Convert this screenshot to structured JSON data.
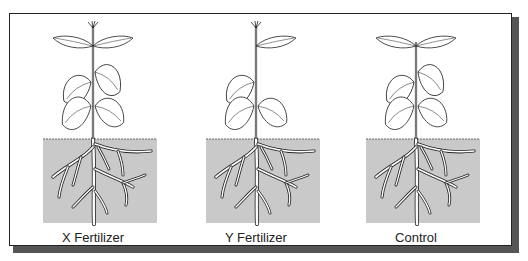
{
  "figure": {
    "panels": [
      {
        "id": "x",
        "label": "X Fertilizer",
        "plant": {
          "has_bud": true,
          "top_left_leaf": true,
          "top_right_leaf": true
        }
      },
      {
        "id": "y",
        "label": "Y Fertilizer",
        "plant": {
          "has_bud": true,
          "top_left_leaf": false,
          "top_right_leaf": true
        }
      },
      {
        "id": "control",
        "label": "Control",
        "plant": {
          "has_bud": false,
          "top_left_leaf": true,
          "top_right_leaf": true
        }
      }
    ]
  },
  "colors": {
    "soil": "#c9c9c9",
    "line": "#222222",
    "frame_shadow": "#555555"
  }
}
